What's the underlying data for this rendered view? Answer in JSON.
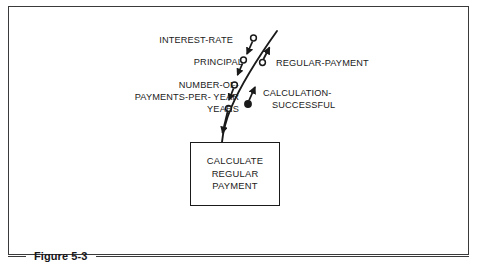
{
  "figure": {
    "caption": "Figure 5-3",
    "frame_color": "#3a3a3c",
    "ink_color": "#1a1a1a",
    "background": "#ffffff"
  },
  "module": {
    "name": "calculate-regular-payment",
    "lines": [
      "CALCULATE",
      "REGULAR",
      "PAYMENT"
    ]
  },
  "couples": {
    "inputs": [
      {
        "label": "INTEREST-RATE",
        "marker": "open-circle",
        "direction": "down"
      },
      {
        "label": "PRINCIPAL",
        "marker": "open-circle",
        "direction": "down"
      },
      {
        "label_line1": "NUMBER-OF-",
        "label_line2": "PAYMENTS-PER- YEAR",
        "marker": "open-circle",
        "direction": "down"
      },
      {
        "label": "YEARS",
        "marker": "open-circle",
        "direction": "down"
      }
    ],
    "outputs": [
      {
        "label": "REGULAR-PAYMENT",
        "marker": "open-circle",
        "direction": "up"
      },
      {
        "label_line1": "CALCULATION-",
        "label_line2": "SUCCESSFUL",
        "marker": "filled-circle",
        "direction": "up"
      }
    ]
  }
}
